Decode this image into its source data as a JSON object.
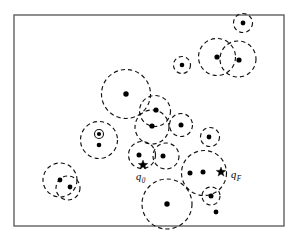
{
  "figure": {
    "background_color": "#ffffff",
    "frame": {
      "name": "workspace-boundary",
      "x": 14,
      "y": 15,
      "width": 270,
      "height": 211,
      "stroke_color": "#606060",
      "stroke_width": 1.4
    },
    "styles": {
      "ball_stroke": "#111111",
      "ball_dash": "4.2 3.1",
      "dot_fill": "#000000",
      "label_color": "#000000"
    },
    "labels": [
      {
        "name": "start-config-label",
        "base": "q",
        "sub": "0",
        "x": 136,
        "y": 180
      },
      {
        "name": "goal-config-label",
        "base": "q",
        "sub": "F",
        "x": 231,
        "y": 178
      }
    ],
    "markers": [
      {
        "name": "start-config-star",
        "x": 143,
        "y": 165,
        "r": 5.0
      },
      {
        "name": "goal-config-star",
        "x": 221,
        "y": 172,
        "r": 5.0
      }
    ],
    "balls": [
      {
        "name": "ball-top-right-small",
        "cx": 243,
        "cy": 23,
        "r": 9.5,
        "dash": "3.0 2.4"
      },
      {
        "name": "ball-upper-right-left",
        "cx": 217,
        "cy": 57,
        "r": 18.5,
        "dash": "4.2 3.1"
      },
      {
        "name": "ball-upper-right-right",
        "cx": 238,
        "cy": 59,
        "r": 18.0,
        "dash": "4.2 3.1"
      },
      {
        "name": "ball-upper-mid-small",
        "cx": 182,
        "cy": 65,
        "r": 8.5,
        "dash": "2.8 2.2"
      },
      {
        "name": "ball-center-large",
        "cx": 126,
        "cy": 94,
        "r": 24.5,
        "dash": "4.4 3.2"
      },
      {
        "name": "ball-center-upper",
        "cx": 155,
        "cy": 111,
        "r": 15.5,
        "dash": "4.0 3.0"
      },
      {
        "name": "ball-center-lower",
        "cx": 152,
        "cy": 127,
        "r": 17.0,
        "dash": "4.0 3.0"
      },
      {
        "name": "ball-mid-right-a",
        "cx": 181,
        "cy": 125,
        "r": 11.5,
        "dash": "3.2 2.5"
      },
      {
        "name": "ball-mid-right-b",
        "cx": 210,
        "cy": 137,
        "r": 9.5,
        "dash": "3.0 2.4"
      },
      {
        "name": "ball-left-concentric",
        "cx": 99,
        "cy": 140,
        "r": 18.5,
        "dash": "4.2 3.1"
      },
      {
        "name": "ball-mid-low-left",
        "cx": 142,
        "cy": 155,
        "r": 13.5,
        "dash": "3.6 2.8"
      },
      {
        "name": "ball-mid-low-right",
        "cx": 166,
        "cy": 156,
        "r": 13.0,
        "dash": "3.6 2.8"
      },
      {
        "name": "ball-bottom-left-a",
        "cx": 60,
        "cy": 180,
        "r": 17.0,
        "dash": "4.0 3.0"
      },
      {
        "name": "ball-bottom-left-b",
        "cx": 68,
        "cy": 188,
        "r": 12.0,
        "dash": "3.4 2.6"
      },
      {
        "name": "ball-goal-large",
        "cx": 204,
        "cy": 173,
        "r": 22.5,
        "dash": "4.4 3.2"
      },
      {
        "name": "ball-goal-small",
        "cx": 211,
        "cy": 196,
        "r": 9.0,
        "dash": "3.0 2.4"
      },
      {
        "name": "ball-bottom-large",
        "cx": 167,
        "cy": 204,
        "r": 25.0,
        "dash": "4.4 3.2"
      }
    ],
    "inner_rings": [
      {
        "name": "inner-ring-left-concentric",
        "cx": 99,
        "cy": 134,
        "r": 4.5
      }
    ],
    "nodes": [
      {
        "name": "node-top-right",
        "cx": 243,
        "cy": 23,
        "r": 2.4
      },
      {
        "name": "node-upper-right-left",
        "cx": 217,
        "cy": 57,
        "r": 2.6
      },
      {
        "name": "node-upper-right-right",
        "cx": 239,
        "cy": 60,
        "r": 2.6
      },
      {
        "name": "node-upper-mid",
        "cx": 182,
        "cy": 65,
        "r": 2.3
      },
      {
        "name": "node-center-large",
        "cx": 126,
        "cy": 94,
        "r": 2.7
      },
      {
        "name": "node-center-upper",
        "cx": 156,
        "cy": 110,
        "r": 2.6
      },
      {
        "name": "node-center-lower",
        "cx": 152,
        "cy": 126,
        "r": 2.6
      },
      {
        "name": "node-mid-right-a",
        "cx": 181,
        "cy": 125,
        "r": 2.5
      },
      {
        "name": "node-mid-right-b",
        "cx": 209,
        "cy": 137,
        "r": 2.4
      },
      {
        "name": "node-left-inner",
        "cx": 99,
        "cy": 134,
        "r": 2.1
      },
      {
        "name": "node-left-lower",
        "cx": 99,
        "cy": 145,
        "r": 2.3
      },
      {
        "name": "node-mid-low-left",
        "cx": 139,
        "cy": 155,
        "r": 2.5
      },
      {
        "name": "node-mid-low-right",
        "cx": 163,
        "cy": 156,
        "r": 2.5
      },
      {
        "name": "node-bottom-left-a",
        "cx": 60,
        "cy": 180,
        "r": 2.4
      },
      {
        "name": "node-bottom-left-b",
        "cx": 70,
        "cy": 187,
        "r": 2.4
      },
      {
        "name": "node-goal-left",
        "cx": 190,
        "cy": 173,
        "r": 2.5
      },
      {
        "name": "node-goal-mid",
        "cx": 203,
        "cy": 172,
        "r": 2.5
      },
      {
        "name": "node-goal-small",
        "cx": 211,
        "cy": 196,
        "r": 2.5
      },
      {
        "name": "node-bottom-large",
        "cx": 167,
        "cy": 204,
        "r": 2.7
      },
      {
        "name": "node-isolated-bottom",
        "cx": 216,
        "cy": 212,
        "r": 2.4
      }
    ]
  }
}
